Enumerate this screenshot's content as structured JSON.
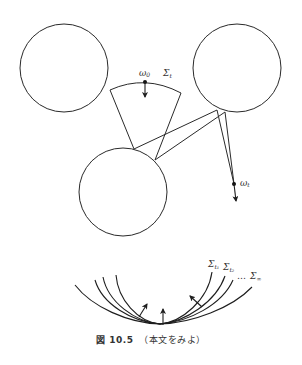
{
  "figure": {
    "caption_prefix": "図 10.5",
    "caption_text": "（本文をみよ）",
    "stroke_color": "#2a2a2a",
    "background": "#ffffff"
  },
  "upper_diagram": {
    "circles": [
      {
        "id": "left",
        "cx": 64,
        "cy": 68,
        "r": 44
      },
      {
        "id": "right",
        "cx": 237,
        "cy": 68,
        "r": 44
      },
      {
        "id": "bottom",
        "cx": 123,
        "cy": 192,
        "r": 44
      }
    ],
    "sector": {
      "arc_start": [
        110,
        90
      ],
      "arc_peak": [
        145,
        82
      ],
      "arc_end": [
        181,
        93
      ],
      "left_edge_end": [
        134,
        149
      ],
      "right_edge_end": [
        155,
        160
      ]
    },
    "point_omega0": {
      "label": "ω",
      "subscript": "0",
      "position": [
        145,
        82
      ],
      "arrow_to": [
        145,
        97
      ]
    },
    "sigma_t_label": {
      "label": "Σ",
      "subscript": "t",
      "position": [
        163,
        76
      ]
    },
    "rays": [
      {
        "from": [
          134,
          149
        ],
        "to": [
          217,
          110
        ]
      },
      {
        "from": [
          155,
          160
        ],
        "to": [
          225,
          112
        ]
      },
      {
        "from": [
          217,
          110
        ],
        "to": [
          234,
          184
        ]
      },
      {
        "from": [
          225,
          112
        ],
        "to": [
          234,
          184
        ]
      }
    ],
    "point_omegat": {
      "label": "ω",
      "subscript": "t",
      "position": [
        234,
        184
      ],
      "arrow_to": [
        236,
        201
      ]
    }
  },
  "lower_diagram": {
    "bottom_point": [
      160,
      324
    ],
    "curves": [
      {
        "left": [
          116,
          275
        ],
        "right": [
          212,
          272
        ]
      },
      {
        "left": [
          103,
          277
        ],
        "right": [
          225,
          276
        ]
      },
      {
        "left": [
          95,
          280
        ],
        "right": [
          233,
          280
        ]
      },
      {
        "left": [
          75,
          285
        ],
        "right": [
          252,
          287
        ]
      }
    ],
    "labels": [
      {
        "label": "Σ",
        "subscript": "t₁",
        "position": [
          209,
          268
        ]
      },
      {
        "label": "Σ",
        "subscript": "t₂",
        "position": [
          224,
          270
        ]
      },
      {
        "label": "…",
        "subscript": "",
        "position": [
          237,
          279
        ]
      },
      {
        "label": "Σ",
        "subscript": "∞",
        "position": [
          250,
          278
        ]
      }
    ],
    "normal_arrows": [
      {
        "from": [
          139,
          317
        ],
        "to": [
          147,
          304
        ]
      },
      {
        "from": [
          163,
          325
        ],
        "to": [
          163,
          309
        ]
      },
      {
        "from": [
          202,
          307
        ],
        "to": [
          190,
          296
        ]
      }
    ]
  }
}
